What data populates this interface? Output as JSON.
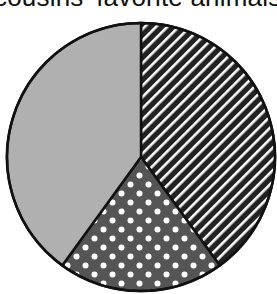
{
  "title": "cousins' favorite animals",
  "chart_data": {
    "type": "pie",
    "title": "cousins' favorite animals",
    "title_visible_fragment": "cousins' favorite ani",
    "categories": [
      "striped",
      "dotted",
      "gray"
    ],
    "values": [
      40,
      20,
      40
    ],
    "unit": "percent (estimated from slice angles)",
    "slices": [
      {
        "pattern": "diagonal-stripes",
        "start_deg": 0,
        "end_deg": 144,
        "color": "#222222",
        "pattern_color": "#ffffff",
        "value": 40
      },
      {
        "pattern": "white-dots",
        "start_deg": 144,
        "end_deg": 216,
        "color": "#555555",
        "pattern_color": "#ffffff",
        "value": 20
      },
      {
        "pattern": "solid",
        "start_deg": 216,
        "end_deg": 360,
        "color": "#b0b0b0",
        "pattern_color": "#b0b0b0",
        "value": 40
      }
    ],
    "legend": "none",
    "labels_on_chart": "none",
    "center": [
      141,
      157
    ],
    "radius": 134
  }
}
